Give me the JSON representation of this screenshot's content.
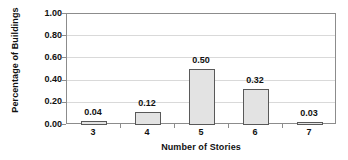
{
  "chart_data": {
    "type": "bar",
    "title": "",
    "xlabel": "Number of Stories",
    "ylabel": "Percentage of Buildings",
    "categories": [
      "3",
      "4",
      "5",
      "6",
      "7"
    ],
    "values": [
      0.04,
      0.12,
      0.5,
      0.32,
      0.03
    ],
    "value_labels": [
      "0.04",
      "0.12",
      "0.50",
      "0.32",
      "0.03"
    ],
    "ylim": [
      0.0,
      1.0
    ],
    "ytick_labels": [
      "1.00",
      "0.80",
      "0.60",
      "0.40",
      "0.20",
      "0.00"
    ],
    "ytick_values": [
      1.0,
      0.8,
      0.6,
      0.4,
      0.2,
      0.0
    ],
    "grid": true,
    "legend": false,
    "colors": {
      "bar_fill": "#e3e3e3",
      "bar_border": "#595959",
      "axis": "#8c8c8c",
      "gridline": "#d9d9d9",
      "text": "#111111",
      "background": "#ffffff"
    }
  }
}
